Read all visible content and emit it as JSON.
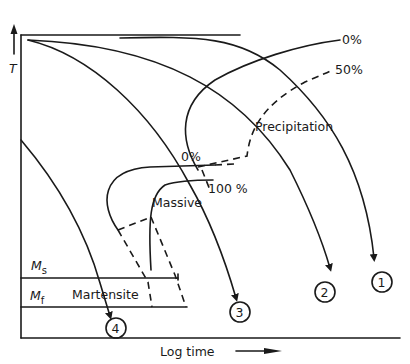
{
  "diagram": {
    "type": "TTT / CCT transformation diagram",
    "axes": {
      "y_label": "T",
      "x_label": "Log time",
      "x_arrow": "right-arrow",
      "y_arrow": "up-arrow"
    },
    "regions": {
      "precipitation": "Precipitation",
      "massive": "Massive",
      "martensite": "Martensite"
    },
    "curve_labels": {
      "precip_start": "0%",
      "precip_half": "50%",
      "massive_start": "0%",
      "massive_end": "100 %"
    },
    "temperatures": {
      "ms": "M",
      "ms_sub": "s",
      "mf": "M",
      "mf_sub": "f"
    },
    "cooling_curves": [
      {
        "id": "1",
        "label": "1"
      },
      {
        "id": "2",
        "label": "2"
      },
      {
        "id": "3",
        "label": "3"
      },
      {
        "id": "4",
        "label": "4"
      }
    ],
    "colors": {
      "line": "#1a1a1a",
      "background": "#ffffff"
    }
  }
}
